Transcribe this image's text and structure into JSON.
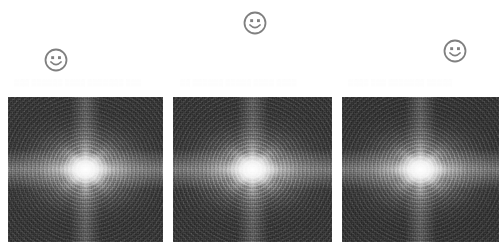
{
  "figure": {
    "background_color": "#ffffff",
    "width": 504,
    "height": 247,
    "panel_count": 3
  },
  "markers": {
    "icon_name": "smiley-face-icon",
    "stroke_color": "#808080",
    "items": [
      {
        "id": "marker-1",
        "label": "",
        "icon": "smiley-face-icon",
        "x": 43,
        "y": 47,
        "size": 26,
        "associated_panel": "panel-1"
      },
      {
        "id": "marker-2",
        "label": "",
        "icon": "smiley-face-icon",
        "x": 242,
        "y": 10,
        "size": 26,
        "associated_panel": "panel-2"
      },
      {
        "id": "marker-3",
        "label": "",
        "icon": "smiley-face-icon",
        "x": 442,
        "y": 38,
        "size": 26,
        "associated_panel": "panel-3"
      }
    ]
  },
  "ghost_text": {
    "note": "near-invisible bleed-through text above the panels, unreadable in the scan",
    "lines": [
      {
        "id": "ghost-1",
        "x": 14,
        "y": 78,
        "width": 150,
        "text": "▒▒▒ ▒▒▒▒▒▒ ▒▒▒▒ ▒▒▒▒▒▒▒ ▒▒▒"
      },
      {
        "id": "ghost-2",
        "x": 180,
        "y": 78,
        "width": 150,
        "text": "▒▒ ▒▒▒▒▒▒ ▒▒▒▒▒ ▒▒▒▒ ▒▒▒▒"
      },
      {
        "id": "ghost-3",
        "x": 348,
        "y": 78,
        "width": 150,
        "text": "▒▒▒▒ ▒▒▒ ▒▒▒▒▒▒▒ ▒▒▒▒▒"
      }
    ]
  },
  "panels": [
    {
      "id": "panel-1",
      "name": "spectrum-panel-1",
      "caption": "",
      "x": 8,
      "y": 97,
      "width": 155,
      "height": 145,
      "base_color": "#3c3c3c",
      "core_color": "#ffffff",
      "has_border": true
    },
    {
      "id": "panel-2",
      "name": "spectrum-panel-2",
      "caption": "",
      "x": 173,
      "y": 97,
      "width": 159,
      "height": 145,
      "base_color": "#3c3c3c",
      "core_color": "#ffffff",
      "has_border": true
    },
    {
      "id": "panel-3",
      "name": "spectrum-panel-3",
      "caption": "",
      "x": 342,
      "y": 97,
      "width": 157,
      "height": 145,
      "base_color": "#3a3a3a",
      "core_color": "#ffffff",
      "has_border": true
    }
  ]
}
